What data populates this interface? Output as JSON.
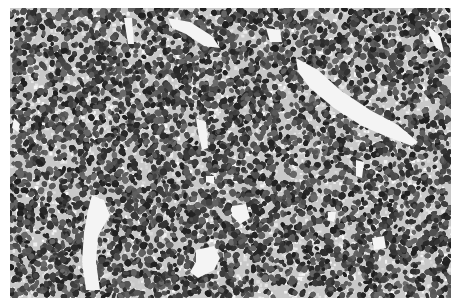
{
  "image": {
    "description": "Grayscale histology micrograph showing densely packed small round tumor cells with scattered white vascular spaces",
    "frame": {
      "x": 10,
      "y": 8,
      "width": 441,
      "height": 290
    },
    "colors": {
      "background": "#ffffff",
      "tissue_base": "#c8c8c8",
      "nucleus_dark": "#2e2e2e",
      "nucleus_mid": "#5a5a5a",
      "space": "#f4f4f4"
    },
    "vessels": [
      [
        [
          296,
          58
        ],
        [
          318,
          70
        ],
        [
          340,
          90
        ],
        [
          370,
          110
        ],
        [
          398,
          125
        ],
        [
          418,
          142
        ],
        [
          412,
          146
        ],
        [
          390,
          138
        ],
        [
          362,
          126
        ],
        [
          334,
          108
        ],
        [
          310,
          88
        ],
        [
          298,
          72
        ]
      ],
      [
        [
          92,
          195
        ],
        [
          104,
          200
        ],
        [
          110,
          215
        ],
        [
          98,
          236
        ],
        [
          96,
          262
        ],
        [
          100,
          290
        ],
        [
          86,
          290
        ],
        [
          82,
          262
        ],
        [
          84,
          232
        ],
        [
          88,
          210
        ]
      ],
      [
        [
          196,
          250
        ],
        [
          214,
          246
        ],
        [
          220,
          258
        ],
        [
          214,
          270
        ],
        [
          198,
          278
        ],
        [
          190,
          272
        ],
        [
          196,
          262
        ]
      ],
      [
        [
          232,
          206
        ],
        [
          246,
          204
        ],
        [
          250,
          218
        ],
        [
          240,
          224
        ],
        [
          232,
          216
        ]
      ],
      [
        [
          372,
          238
        ],
        [
          384,
          236
        ],
        [
          386,
          248
        ],
        [
          374,
          250
        ]
      ],
      [
        [
          168,
          18
        ],
        [
          190,
          22
        ],
        [
          212,
          36
        ],
        [
          220,
          48
        ],
        [
          204,
          46
        ],
        [
          186,
          34
        ],
        [
          172,
          28
        ]
      ],
      [
        [
          196,
          118
        ],
        [
          206,
          122
        ],
        [
          208,
          148
        ],
        [
          202,
          150
        ],
        [
          198,
          132
        ]
      ],
      [
        [
          266,
          28
        ],
        [
          280,
          30
        ],
        [
          282,
          42
        ],
        [
          270,
          42
        ]
      ],
      [
        [
          356,
          160
        ],
        [
          364,
          162
        ],
        [
          362,
          178
        ],
        [
          356,
          176
        ]
      ],
      [
        [
          428,
          26
        ],
        [
          440,
          36
        ],
        [
          444,
          52
        ],
        [
          436,
          48
        ],
        [
          430,
          36
        ]
      ],
      [
        [
          124,
          18
        ],
        [
          132,
          18
        ],
        [
          134,
          44
        ],
        [
          128,
          44
        ]
      ],
      [
        [
          14,
          118
        ],
        [
          20,
          124
        ],
        [
          18,
          132
        ],
        [
          12,
          128
        ]
      ],
      [
        [
          206,
          176
        ],
        [
          214,
          176
        ],
        [
          214,
          184
        ],
        [
          206,
          182
        ]
      ],
      [
        [
          328,
          212
        ],
        [
          336,
          212
        ],
        [
          334,
          222
        ],
        [
          328,
          220
        ]
      ]
    ],
    "seed": 1337,
    "cell_count": 14000
  }
}
